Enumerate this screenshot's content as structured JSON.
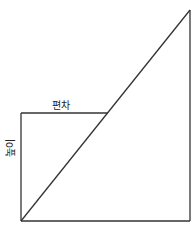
{
  "diagram": {
    "labels": {
      "top": "편차",
      "side": "높이"
    },
    "colors": {
      "stroke": "#333333",
      "background": "#ffffff"
    }
  }
}
